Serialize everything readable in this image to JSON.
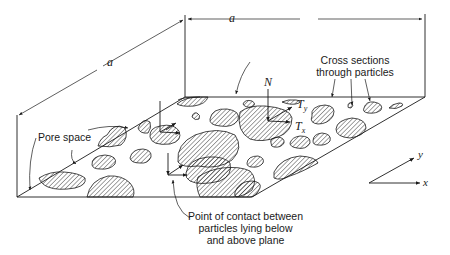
{
  "figure": {
    "dimension_labels": {
      "top": "a",
      "side": "a"
    },
    "labels": {
      "cross_sections": [
        "Cross sections",
        "through particles"
      ],
      "pore_space": "Pore space",
      "contact_point": [
        "Point of contact between",
        "particles lying below",
        "and above plane"
      ]
    },
    "force_labels": {
      "normal": "N",
      "tangent_y": "T",
      "tangent_y_sub": "y",
      "tangent_x": "T",
      "tangent_x_sub": "x"
    },
    "axes": {
      "x": "x",
      "y": "y"
    },
    "colors": {
      "ink": "#1a1a1a",
      "background": "#ffffff"
    }
  }
}
